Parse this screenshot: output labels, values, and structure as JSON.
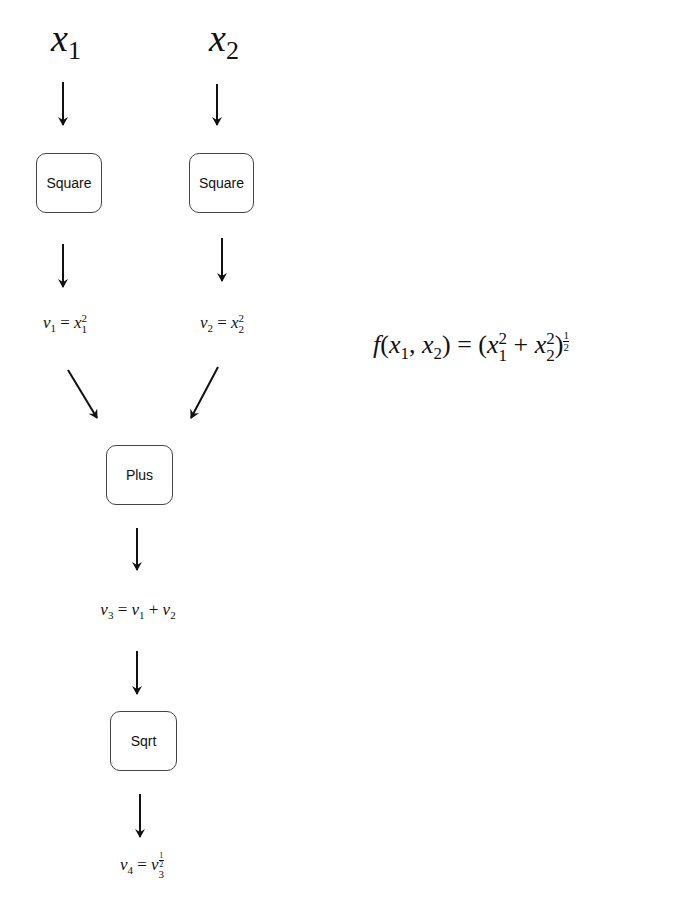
{
  "inputs": [
    {
      "symbol": "x",
      "index": "1"
    },
    {
      "symbol": "x",
      "index": "2"
    }
  ],
  "nodes": {
    "square1": "Square",
    "square2": "Square",
    "plus": "Plus",
    "sqrt": "Sqrt"
  },
  "equations": {
    "v1": {
      "lhs": "v",
      "lhs_idx": "1",
      "eq": "=",
      "rhs": "x",
      "rhs_sup": "2",
      "rhs_sub": "1"
    },
    "v2": {
      "lhs": "v",
      "lhs_idx": "2",
      "eq": "=",
      "rhs": "x",
      "rhs_sup": "2",
      "rhs_sub": "2"
    },
    "v3": {
      "lhs": "v",
      "lhs_idx": "3",
      "eq": "=",
      "a": "v",
      "a_idx": "1",
      "op": "+",
      "b": "v",
      "b_idx": "2"
    },
    "v4": {
      "lhs": "v",
      "lhs_idx": "4",
      "eq": "=",
      "rhs": "v",
      "rhs_sub": "3",
      "sup_num": "1",
      "sup_den": "2"
    }
  },
  "function": {
    "f": "f",
    "open": "(",
    "x": "x",
    "i1": "1",
    "comma": ",",
    "i2": "2",
    "close": ")",
    "eq": "=",
    "lp": "(",
    "plus": "+",
    "sq": "2",
    "rp": ")",
    "num": "1",
    "den": "2"
  }
}
